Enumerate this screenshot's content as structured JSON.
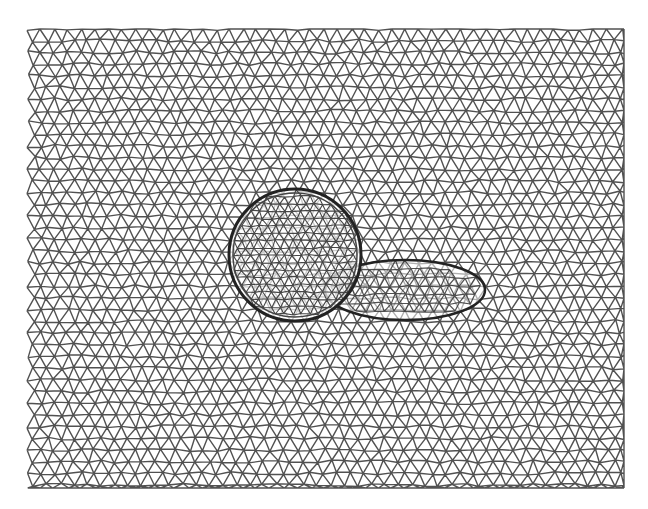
{
  "figure": {
    "type": "triangulated-mesh",
    "background": "#ffffff",
    "stroke_color": "#333333",
    "mesh_bounds": {
      "x0": 27,
      "y0": 29,
      "x1": 624,
      "y1": 488
    },
    "base_spacing": 13.5,
    "objects": [
      {
        "name": "sphere",
        "shape": "circle",
        "cx": 295,
        "cy": 255,
        "r": 66
      },
      {
        "name": "ellipsoid",
        "shape": "ellipse",
        "cx": 405,
        "cy": 290,
        "rx": 80,
        "ry": 30
      }
    ]
  }
}
